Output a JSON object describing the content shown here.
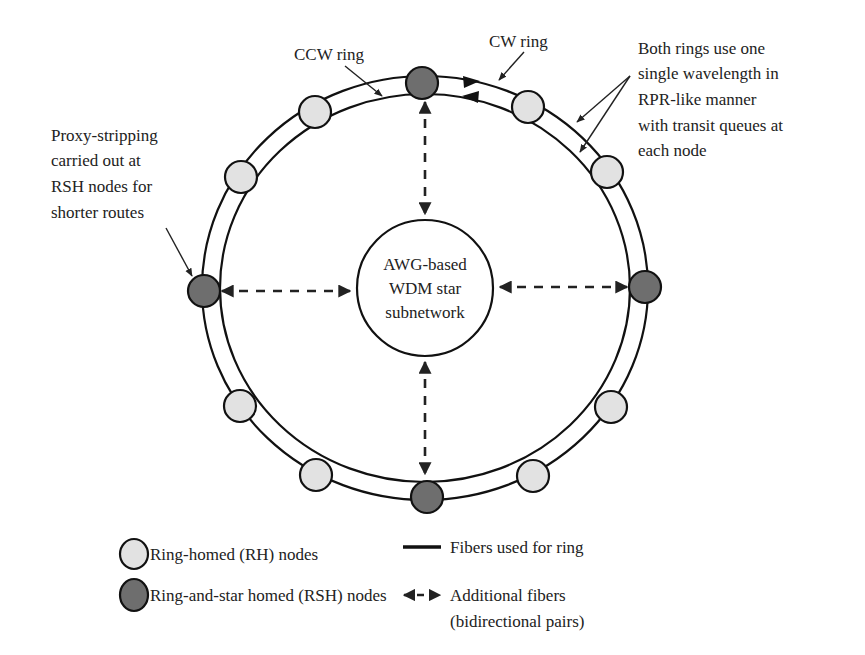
{
  "diagram": {
    "center": {
      "line1": "AWG-based",
      "line2": "WDM star",
      "line3": "subnetwork"
    },
    "ring_labels": {
      "ccw": "CCW ring",
      "cw": "CW ring"
    },
    "annotations": {
      "proxy": [
        "Proxy-stripping",
        "carried out at",
        "RSH nodes for",
        "shorter routes"
      ],
      "both_rings": [
        "Both rings use one",
        "single wavelength in",
        "RPR-like manner",
        "with transit queues at",
        "each node"
      ]
    },
    "nodes": [
      {
        "id": "top",
        "type": "RSH",
        "angle_deg": 270
      },
      {
        "id": "right",
        "type": "RSH",
        "angle_deg": 0
      },
      {
        "id": "bottom",
        "type": "RSH",
        "angle_deg": 90
      },
      {
        "id": "left",
        "type": "RSH",
        "angle_deg": 180
      },
      {
        "id": "rh-1",
        "type": "RH",
        "angle_deg": 300
      },
      {
        "id": "rh-2",
        "type": "RH",
        "angle_deg": 330
      },
      {
        "id": "rh-3",
        "type": "RH",
        "angle_deg": 30
      },
      {
        "id": "rh-4",
        "type": "RH",
        "angle_deg": 60
      },
      {
        "id": "rh-5",
        "type": "RH",
        "angle_deg": 120
      },
      {
        "id": "rh-6",
        "type": "RH",
        "angle_deg": 150
      },
      {
        "id": "rh-7",
        "type": "RH",
        "angle_deg": 210
      },
      {
        "id": "rh-8",
        "type": "RH",
        "angle_deg": 240
      }
    ],
    "colors": {
      "rh_fill": "#e2e2e2",
      "rsh_fill": "#6e6e6e",
      "line": "#111111"
    }
  },
  "legend": {
    "rh": "Ring-homed (RH) nodes",
    "rsh": "Ring-and-star homed (RSH) nodes",
    "solid": "Fibers used for ring",
    "dashed_line1": "Additional fibers",
    "dashed_line2": "(bidirectional pairs)"
  }
}
